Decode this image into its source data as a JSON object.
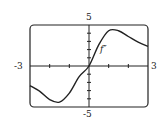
{
  "chart_data": {
    "type": "line",
    "title": "",
    "curve_label": "f″",
    "xlim": [
      -3,
      3
    ],
    "ylim": [
      -5,
      5
    ],
    "x_tick_labels": [
      "-3",
      "3"
    ],
    "y_tick_labels": [
      "5",
      "-5"
    ],
    "grid": false,
    "x": [
      -3,
      -2.5,
      -2,
      -1.5,
      -1,
      -0.5,
      0,
      0.5,
      1,
      1.5,
      2,
      2.5,
      3
    ],
    "values": [
      -2.4,
      -3.1,
      -4.1,
      -4.4,
      -3.3,
      -1.3,
      0,
      2.6,
      4.3,
      4.3,
      3.6,
      2.9,
      2.4
    ]
  },
  "labels": {
    "ymax": "5",
    "ymin": "-5",
    "xmin": "-3",
    "xmax": "3",
    "curve": "f″"
  }
}
